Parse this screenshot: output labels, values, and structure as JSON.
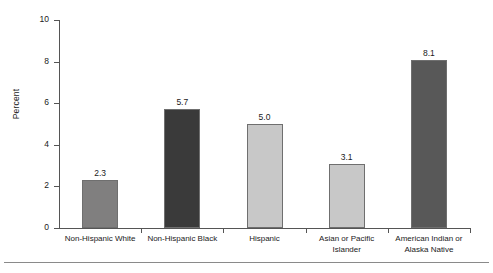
{
  "chart_data": {
    "type": "bar",
    "title": "",
    "subtitle": "",
    "xlabel": "",
    "ylabel": "Percent",
    "ylim": [
      0,
      10
    ],
    "yticks": [
      0,
      2,
      4,
      6,
      8,
      10
    ],
    "ytick_labels": [
      "0",
      "2",
      "4",
      "6",
      "8",
      "10"
    ],
    "grid": false,
    "legend": null,
    "categories": [
      "Non-Hispanic White",
      "Non-Hispanic Black",
      "Hispanic",
      "Asian or Pacific\nIslander",
      "American Indian or\nAlaska Native"
    ],
    "values": [
      2.3,
      5.7,
      5.0,
      3.1,
      8.1
    ],
    "value_labels": [
      "2.3",
      "5.7",
      "5.0",
      "3.1",
      "8.1"
    ],
    "bar_colors": [
      "#807f7f",
      "#3a3a3a",
      "#c8c8c8",
      "#c8c8c8",
      "#585858"
    ]
  },
  "axes": {
    "y_axis_title": "Percent"
  },
  "colors": {
    "axis": "#555555",
    "text": "#1a1a1a",
    "bar_outline": "#6f6f6f",
    "footer_rule": "#8a8a8a",
    "background": "#ffffff"
  }
}
